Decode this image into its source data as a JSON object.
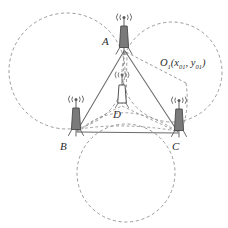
{
  "figure": {
    "kind": "trilateration-geometry-diagram",
    "width": 228,
    "height": 228,
    "background_color": "#ffffff"
  },
  "labels": {
    "vertex_a": "A",
    "vertex_b": "B",
    "vertex_c": "C",
    "vertex_d": "D",
    "circle_center_o1_prefix": "O",
    "circle_center_o1_sub": "1",
    "circle_center_o1_open": "(",
    "circle_center_o1_x": "x",
    "circle_center_o1_x_sub": "01",
    "circle_center_o1_comma": ", ",
    "circle_center_o1_y": "y",
    "circle_center_o1_y_sub": "01",
    "circle_center_o1_close": ")"
  },
  "colors": {
    "stroke_solid": "#6b6b6b",
    "stroke_dashed": "#8a8a8a",
    "antenna_fill_dark": "#777777",
    "antenna_fill_light": "#ffffff",
    "antenna_outline": "#4a4a4a",
    "text": "#2b2b2b"
  },
  "geometry": {
    "vertices": {
      "A": {
        "x": 124,
        "y": 50
      },
      "B": {
        "x": 76,
        "y": 132
      },
      "C": {
        "x": 179,
        "y": 133
      },
      "D": {
        "x": 122,
        "y": 105
      }
    },
    "circles": [
      {
        "name": "circle-left",
        "cx": 67,
        "cy": 71,
        "r": 58,
        "style": "dashed"
      },
      {
        "name": "circle-right",
        "cx": 172,
        "cy": 72,
        "r": 50,
        "style": "dashed"
      },
      {
        "name": "circle-bottom",
        "cx": 126,
        "cy": 173,
        "r": 49,
        "style": "dashed"
      }
    ],
    "solid_edges": [
      {
        "name": "edge-ab",
        "from": "A",
        "to": "B"
      },
      {
        "name": "edge-ac",
        "from": "A",
        "to": "C"
      },
      {
        "name": "edge-bc",
        "from": "B",
        "to": "C"
      }
    ],
    "dashed_edges": [
      {
        "name": "edge-ad",
        "from": "A",
        "to": "D"
      },
      {
        "name": "edge-a-o1",
        "from": "A",
        "to": "O1"
      },
      {
        "name": "edge-db",
        "from": "D",
        "to": "B"
      },
      {
        "name": "edge-dc",
        "from": "D",
        "to": "C"
      }
    ],
    "label_positions": {
      "A": {
        "x": 103,
        "y": 41
      },
      "B": {
        "x": 62,
        "y": 147
      },
      "C": {
        "x": 175,
        "y": 147
      },
      "D": {
        "x": 115,
        "y": 112
      },
      "O1": {
        "x": 163,
        "y": 62
      }
    }
  },
  "antennas": [
    {
      "name": "antenna-a",
      "at": "A",
      "x": 124,
      "y": 50,
      "fill": "dark"
    },
    {
      "name": "antenna-b",
      "at": "B",
      "x": 76,
      "y": 132,
      "fill": "dark"
    },
    {
      "name": "antenna-c",
      "at": "C",
      "x": 179,
      "y": 133,
      "fill": "dark"
    },
    {
      "name": "antenna-d",
      "at": "D",
      "x": 122,
      "y": 105,
      "fill": "light"
    }
  ]
}
